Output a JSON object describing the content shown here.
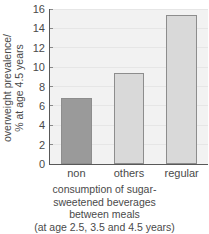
{
  "chart_data": {
    "type": "bar",
    "title": "",
    "categories": [
      "non",
      "others",
      "regular"
    ],
    "values": [
      6.8,
      9.4,
      15.4
    ],
    "series": [
      {
        "name": "overweight prevalence",
        "values": [
          6.8,
          9.4,
          15.4
        ]
      }
    ],
    "xlabel": "consumption of sugar-sweetened beverages between meals (at age 2.5, 3.5 and 4.5 years)",
    "ylabel": "overweight prevalence/ % at age 4.5 years",
    "ylim": [
      0,
      16
    ],
    "yticks": [
      0,
      2,
      4,
      6,
      8,
      10,
      12,
      14,
      16
    ],
    "ytick_labels": [
      "0",
      "2",
      "4",
      "6",
      "8",
      "10",
      "12",
      "14",
      "16"
    ],
    "grid": true,
    "legend": "none",
    "bar_colors": [
      "#9a9a9a",
      "#d9d9d9",
      "#d9d9d9"
    ],
    "bar_edge_color": "#8d8d8d",
    "plot_background": "#f2f2f2",
    "axis_color": "#585858"
  },
  "axis": {
    "y_title_lines": [
      "overweight prevalence/",
      "% at age 4.5 years"
    ],
    "y_tick_labels": [
      "16",
      "14",
      "12",
      "10",
      "8",
      "6",
      "4",
      "2",
      "0"
    ],
    "x_tick_labels": [
      "non",
      "others",
      "regular"
    ]
  },
  "caption": {
    "lines": [
      "consumption of sugar-",
      "sweetened beverages",
      "between meals",
      "(at age 2.5, 3.5 and 4.5 years)"
    ]
  }
}
